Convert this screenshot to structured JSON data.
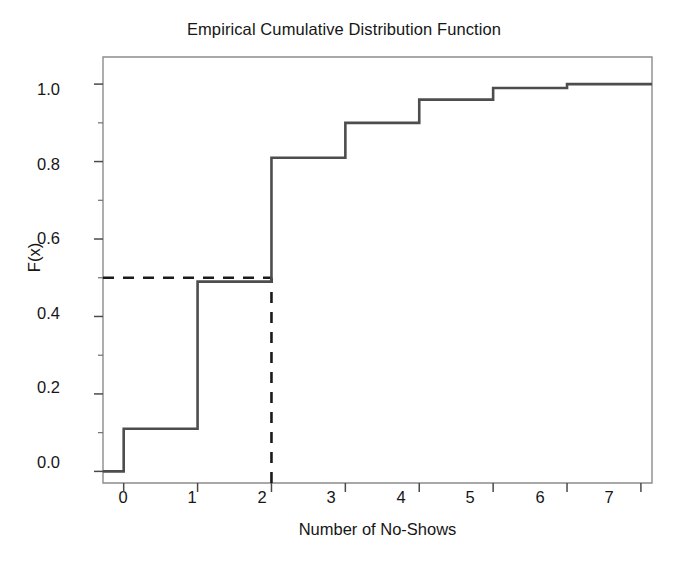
{
  "chart_data": {
    "type": "line",
    "step": "post",
    "title": "Empirical Cumulative Distribution Function",
    "xlabel": "Number of No-Shows",
    "ylabel": "F(x)",
    "x": [
      0,
      1,
      2,
      3,
      4,
      5,
      6,
      7
    ],
    "values": [
      0.11,
      0.49,
      0.81,
      0.9,
      0.96,
      0.99,
      1.0,
      1.0
    ],
    "series": [
      {
        "name": "ECDF",
        "x": [
          0,
          1,
          2,
          3,
          4,
          5,
          6,
          7
        ],
        "values": [
          0.11,
          0.49,
          0.81,
          0.9,
          0.96,
          0.99,
          1.0,
          1.0
        ]
      }
    ],
    "xlim": [
      -0.28,
      7.15
    ],
    "ylim": [
      -0.03,
      1.07
    ],
    "xticks": [
      0,
      1,
      2,
      3,
      4,
      5,
      6,
      7
    ],
    "xtick_labels": [
      "0",
      "1",
      "2",
      "3",
      "4",
      "5",
      "6",
      "7"
    ],
    "yticks": [
      0.0,
      0.2,
      0.4,
      0.6,
      0.8,
      1.0
    ],
    "ytick_labels": [
      "0.0",
      "0.2",
      "0.4",
      "0.6",
      "0.8",
      "1.0"
    ],
    "y_minor_ticks": [
      0.1,
      0.3,
      0.5,
      0.7,
      0.9
    ],
    "grid": false,
    "legend": null,
    "annotations": [
      {
        "kind": "reference-line",
        "orientation": "horizontal",
        "value": 0.5,
        "style": "dashed",
        "x_from": 0,
        "x_to": 2,
        "label": "median level F(x) = 0.5"
      },
      {
        "kind": "reference-line",
        "orientation": "vertical",
        "value": 2,
        "style": "dashed",
        "y_from": 0.0,
        "y_to": 0.5,
        "label": "median x = 2"
      }
    ],
    "colors": {
      "line": "#4d4d4d",
      "reference_line": "#1a1a1a",
      "axis": "#8c8c8c",
      "text": "#161616",
      "background": "#ffffff"
    }
  }
}
